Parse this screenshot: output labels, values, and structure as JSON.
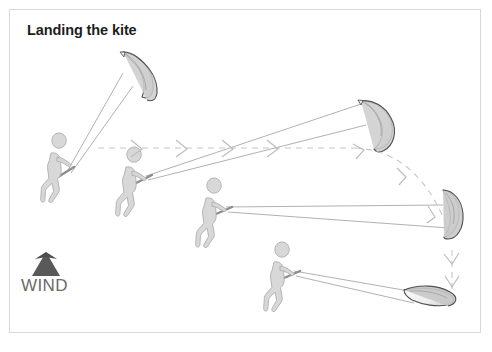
{
  "page": {
    "width": 492,
    "height": 352,
    "background_color": "#ffffff",
    "border_color": "#d8d8d8"
  },
  "diagram": {
    "title": "Landing the kite",
    "title_color": "#1d1d1d",
    "wind_label": "WIND",
    "wind_label_color": "#6a6a6a",
    "wind_arrow_direction": "up",
    "wind_arrow_color": "#595959",
    "palette": {
      "figure_fill": "#d6d6d6",
      "figure_stroke": "#a8a8a8",
      "kite_fill": "#f2f2f2",
      "kite_shade": "#cfcfcf",
      "kite_stroke": "#555555",
      "line_stroke": "#9a9a9a",
      "dashed_path": "#c9c9c9"
    },
    "steps": [
      {
        "index": 1,
        "label": "kite-overhead-left",
        "rider_x": 52,
        "rider_y": 168,
        "kite_x": 143,
        "kite_y": 68,
        "description": "Kite flying high overhead, rider upwind at far left"
      },
      {
        "index": 2,
        "label": "kite-lowering-forward",
        "rider_x": 127,
        "rider_y": 182,
        "kite_x": 376,
        "kite_y": 118,
        "description": "Kite steered downwind across the window"
      },
      {
        "index": 3,
        "label": "kite-at-edge",
        "rider_x": 207,
        "rider_y": 213,
        "kite_x": 455,
        "kite_y": 212,
        "description": "Kite brought down to the edge of the window"
      },
      {
        "index": 4,
        "label": "kite-landed",
        "rider_x": 275,
        "rider_y": 277,
        "kite_x": 432,
        "kite_y": 298,
        "description": "Kite landed flat on the ground, leading edge down"
      }
    ],
    "trajectory": {
      "style": "dashed-with-chevrons",
      "segments": [
        {
          "name": "upper-horizontal-run",
          "from_x": 98,
          "from_y": 148,
          "to_x": 360,
          "to_y": 148
        },
        {
          "name": "descending-arc",
          "from_x": 360,
          "from_y": 148,
          "to_x": 455,
          "to_y": 245
        },
        {
          "name": "final-drop",
          "from_x": 455,
          "from_y": 250,
          "to_x": 455,
          "to_y": 296
        }
      ]
    }
  }
}
